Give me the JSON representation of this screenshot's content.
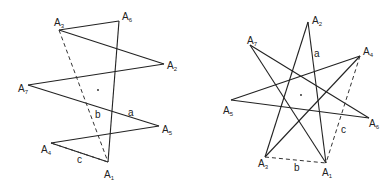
{
  "figures": [
    {
      "name": "heptagram-7-2",
      "vertices": [
        {
          "label": "A",
          "sub": "1",
          "x": 108,
          "y": 162,
          "lx": 104,
          "ly": 178
        },
        {
          "label": "A",
          "sub": "2",
          "x": 164,
          "y": 64,
          "lx": 167,
          "ly": 69
        },
        {
          "label": "A",
          "sub": "3",
          "x": 59,
          "y": 30,
          "lx": 54,
          "ly": 26
        },
        {
          "label": "A",
          "sub": "4",
          "x": 51,
          "y": 143,
          "lx": 41,
          "ly": 153
        },
        {
          "label": "A",
          "sub": "5",
          "x": 159,
          "y": 126,
          "lx": 162,
          "ly": 133
        },
        {
          "label": "A",
          "sub": "6",
          "x": 119,
          "y": 21,
          "lx": 122,
          "ly": 20
        },
        {
          "label": "A",
          "sub": "7",
          "x": 28,
          "y": 85,
          "lx": 18,
          "ly": 92
        }
      ],
      "edges": [
        [
          2,
          1
        ],
        [
          1,
          6
        ],
        [
          6,
          4
        ],
        [
          4,
          3
        ],
        [
          3,
          0
        ],
        [
          0,
          5
        ],
        [
          5,
          2
        ]
      ],
      "edges_comment": "index pairs into vertices",
      "dashed": [
        [
          2,
          0
        ],
        [
          3,
          0
        ]
      ],
      "center": {
        "x": 98,
        "y": 90
      },
      "side_labels": [
        {
          "text": "a",
          "x": 128,
          "y": 116
        },
        {
          "text": "b",
          "x": 95,
          "y": 118
        },
        {
          "text": "c",
          "x": 77,
          "y": 163
        }
      ]
    },
    {
      "name": "heptagram-7-3",
      "vertices": [
        {
          "label": "A",
          "sub": "1",
          "x": 326,
          "y": 163,
          "lx": 322,
          "ly": 176
        },
        {
          "label": "A",
          "sub": "2",
          "x": 308,
          "y": 22,
          "lx": 312,
          "ly": 24
        },
        {
          "label": "A",
          "sub": "3",
          "x": 265,
          "y": 157,
          "lx": 258,
          "ly": 167
        },
        {
          "label": "A",
          "sub": "4",
          "x": 360,
          "y": 56,
          "lx": 363,
          "ly": 55
        },
        {
          "label": "A",
          "sub": "5",
          "x": 231,
          "y": 100,
          "lx": 223,
          "ly": 114
        },
        {
          "label": "A",
          "sub": "6",
          "x": 369,
          "y": 118,
          "lx": 369,
          "ly": 127
        },
        {
          "label": "A",
          "sub": "7",
          "x": 250,
          "y": 45,
          "lx": 247,
          "ly": 44
        }
      ],
      "edges": [
        [
          1,
          2
        ],
        [
          2,
          3
        ],
        [
          3,
          4
        ],
        [
          4,
          5
        ],
        [
          5,
          6
        ],
        [
          6,
          0
        ],
        [
          0,
          1
        ]
      ],
      "dashed": [
        [
          2,
          0
        ],
        [
          3,
          0
        ]
      ],
      "center": {
        "x": 301,
        "y": 95
      },
      "side_labels": [
        {
          "text": "a",
          "x": 314,
          "y": 57
        },
        {
          "text": "b",
          "x": 294,
          "y": 171
        },
        {
          "text": "c",
          "x": 341,
          "y": 133
        }
      ]
    }
  ]
}
